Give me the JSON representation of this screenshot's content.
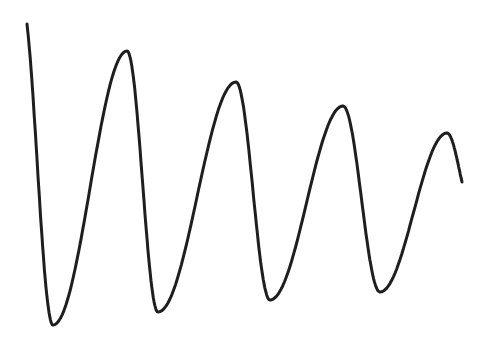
{
  "chart_data": {
    "type": "line",
    "title": "",
    "xlabel": "",
    "ylabel": "",
    "grid": false,
    "legend": null,
    "line_color": "#1e1e1e",
    "points_px": [
      [
        27,
        24
      ],
      [
        53,
        325
      ],
      [
        127,
        51
      ],
      [
        158,
        312
      ],
      [
        236,
        82
      ],
      [
        270,
        300
      ],
      [
        343,
        106
      ],
      [
        380,
        292
      ],
      [
        447,
        133
      ],
      [
        462,
        182
      ]
    ],
    "series": [
      {
        "name": "signal",
        "extrema": [
          {
            "kind": "start",
            "x": 27,
            "y": 24
          },
          {
            "kind": "min",
            "x": 53,
            "y": 325
          },
          {
            "kind": "max",
            "x": 127,
            "y": 51
          },
          {
            "kind": "min",
            "x": 158,
            "y": 312
          },
          {
            "kind": "max",
            "x": 236,
            "y": 82
          },
          {
            "kind": "min",
            "x": 270,
            "y": 300
          },
          {
            "kind": "max",
            "x": 343,
            "y": 106
          },
          {
            "kind": "min",
            "x": 380,
            "y": 292
          },
          {
            "kind": "max",
            "x": 447,
            "y": 133
          },
          {
            "kind": "end",
            "x": 462,
            "y": 182
          }
        ]
      }
    ]
  }
}
